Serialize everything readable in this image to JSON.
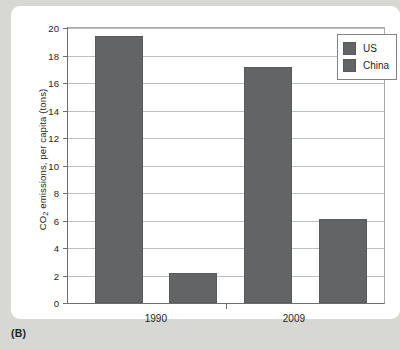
{
  "figure": {
    "caption": "(B)"
  },
  "chart_data": {
    "type": "bar",
    "title": "",
    "subtitle": "",
    "xlabel": "",
    "ylabel": "CO2 emissions, per capita (tons)",
    "ylabel_parts": {
      "prefix": "CO",
      "subscript": "2",
      "suffix": " emissions, per capita (tons)"
    },
    "categories": [
      "1990",
      "2009"
    ],
    "series": [
      {
        "name": "US",
        "values": [
          19.45,
          17.2
        ],
        "color": "#636466"
      },
      {
        "name": "China",
        "values": [
          2.2,
          6.1
        ],
        "color": "#636466"
      }
    ],
    "ylim": [
      0,
      20
    ],
    "yticks": [
      0,
      2,
      4,
      6,
      8,
      10,
      12,
      14,
      16,
      18,
      20
    ],
    "ytick_labels": [
      "0",
      "2",
      "4",
      "6",
      "8",
      "10",
      "12",
      "14",
      "16",
      "18",
      "20"
    ],
    "grid": true,
    "grid_axis": "y",
    "legend": {
      "position": "top-right",
      "entries": [
        {
          "label": "US",
          "color": "#636466"
        },
        {
          "label": "China",
          "color": "#636466"
        }
      ]
    },
    "bar_geometry": {
      "bars": [
        {
          "series": "US",
          "category": "1990",
          "value": 19.45,
          "left_pct": 8.5,
          "width_pct": 15.2
        },
        {
          "series": "China",
          "category": "1990",
          "value": 2.2,
          "left_pct": 32.0,
          "width_pct": 15.2
        },
        {
          "series": "US",
          "category": "2009",
          "value": 17.2,
          "left_pct": 55.7,
          "width_pct": 15.2
        },
        {
          "series": "China",
          "category": "2009",
          "value": 6.1,
          "left_pct": 79.4,
          "width_pct": 15.2
        }
      ]
    },
    "xtick_positions_pct": [
      27.8,
      71.5
    ],
    "x_divider_pct": 50.0
  },
  "colors": {
    "page_background": "#d7d7d3",
    "panel_background": "#ffffff",
    "bar_fill": "#636466",
    "bar_stroke": "#58595b",
    "gridline": "#bcbec0",
    "axis": "#6d6e71",
    "text": "#231f20"
  }
}
